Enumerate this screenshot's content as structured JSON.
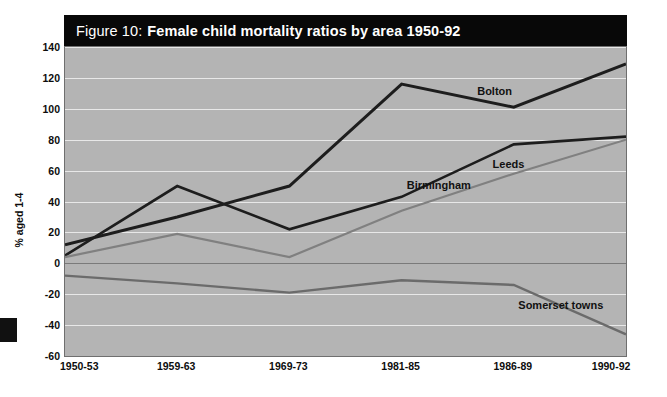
{
  "figure": {
    "number_label": "Figure 10:",
    "title": "Female child mortality ratios by area 1950-92"
  },
  "axis": {
    "y_title": "% aged 1-4",
    "y_ticks": [
      "140",
      "120",
      "100",
      "80",
      "60",
      "40",
      "20",
      "0",
      "-20",
      "-40",
      "-60"
    ],
    "x_ticks": [
      "1950-53",
      "1959-63",
      "1969-73",
      "1981-85",
      "1986-89",
      "1990-92"
    ]
  },
  "annotations": {
    "bolton": "Bolton",
    "birmingham": "Birmingham",
    "leeds": "Leeds",
    "somerset": "Somerset towns"
  },
  "colors": {
    "plot_background": "#b4b4b4",
    "title_background": "#080808",
    "gridline": "#e8e8e8",
    "zero_line": "#7a7a7a",
    "series_dark": "#1d1d1d",
    "series_mid": "#3a3a3a",
    "series_light": "#808080",
    "series_grey": "#6b6b6b"
  },
  "chart_data": {
    "type": "line",
    "title": "Figure 10: Female child mortality ratios by area 1950-92",
    "xlabel": "",
    "ylabel": "% aged 1-4",
    "ylim": [
      -60,
      140
    ],
    "ytick_step": 20,
    "grid": true,
    "legend": "inline-annotations",
    "categories": [
      "1950-53",
      "1959-63",
      "1969-73",
      "1981-85",
      "1986-89",
      "1990-92"
    ],
    "series": [
      {
        "name": "Bolton",
        "color": "#1d1d1d",
        "values": [
          12,
          30,
          50,
          116,
          101,
          129
        ]
      },
      {
        "name": "Birmingham",
        "color": "#1d1d1d",
        "values": [
          5,
          50,
          22,
          43,
          77,
          82
        ]
      },
      {
        "name": "Leeds",
        "color": "#808080",
        "values": [
          4,
          19,
          4,
          34,
          58,
          80
        ]
      },
      {
        "name": "Somerset towns",
        "color": "#6b6b6b",
        "values": [
          -8,
          -13,
          -19,
          -11,
          -14,
          -46
        ]
      }
    ]
  }
}
